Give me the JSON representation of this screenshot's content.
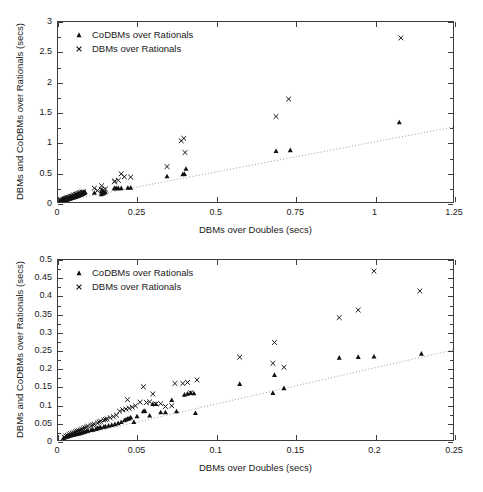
{
  "figure": {
    "panels": [
      {
        "id": "top",
        "axis": {
          "xlabel": "DBMs over Doubles (secs)",
          "ylabel": "DBMs and CoDBMs over Rationals (secs)",
          "xticks": [
            "0",
            "0.25",
            "0.5",
            "0.75",
            "1",
            "1.25"
          ],
          "yticks": [
            "0",
            "0.5",
            "1",
            "1.5",
            "2",
            "2.5",
            "3"
          ],
          "xlim": [
            0,
            1.25
          ],
          "ylim": [
            0,
            3
          ]
        },
        "legend": {
          "items": [
            {
              "label": "CoDBMs over Rationals",
              "marker": "triangle-marker"
            },
            {
              "label": "DBMs over Rationals",
              "marker": "cross-marker"
            }
          ]
        }
      },
      {
        "id": "bottom",
        "axis": {
          "xlabel": "DBMs over Doubles (secs)",
          "ylabel": "DBMs and CoDBMs over Rationals (secs)",
          "xticks": [
            "0",
            "0.05",
            "0.1",
            "0.15",
            "0.2",
            "0.25"
          ],
          "yticks": [
            "0",
            "0.05",
            "0.1",
            "0.15",
            "0.2",
            "0.25",
            "0.3",
            "0.35",
            "0.4",
            "0.45",
            "0.5"
          ],
          "xlim": [
            0,
            0.25
          ],
          "ylim": [
            0,
            0.5
          ]
        },
        "legend": {
          "items": [
            {
              "label": "CoDBMs over Rationals",
              "marker": "triangle-marker"
            },
            {
              "label": "DBMs over Rationals",
              "marker": "cross-marker"
            }
          ]
        }
      }
    ]
  },
  "colors": {
    "axis": "#3c3c3c",
    "marker": "#111111",
    "reference_line": "#9a9a9a",
    "background": "#ffffff"
  },
  "chart_data": [
    {
      "type": "scatter",
      "panel": "top",
      "title": "",
      "xlabel": "DBMs over Doubles (secs)",
      "ylabel": "DBMs and CoDBMs over Rationals (secs)",
      "xlim": [
        0,
        1.25
      ],
      "ylim": [
        0,
        3
      ],
      "grid": false,
      "legend_position": "upper-left-inside",
      "annotations": [
        {
          "kind": "reference-line",
          "label": "y = x (identity, dotted)",
          "from": [
            0,
            0
          ],
          "to": [
            1.25,
            1.25
          ],
          "style": "dotted",
          "note": "dotted guide line spanning plot"
        }
      ],
      "series": [
        {
          "name": "CoDBMs over Rationals",
          "marker": "triangle",
          "points": [
            [
              0.004,
              0.006
            ],
            [
              0.006,
              0.009
            ],
            [
              0.008,
              0.012
            ],
            [
              0.01,
              0.015
            ],
            [
              0.012,
              0.018
            ],
            [
              0.014,
              0.021
            ],
            [
              0.015,
              0.024
            ],
            [
              0.017,
              0.026
            ],
            [
              0.019,
              0.029
            ],
            [
              0.021,
              0.032
            ],
            [
              0.023,
              0.034
            ],
            [
              0.025,
              0.037
            ],
            [
              0.027,
              0.04
            ],
            [
              0.029,
              0.043
            ],
            [
              0.031,
              0.046
            ],
            [
              0.033,
              0.05
            ],
            [
              0.036,
              0.054
            ],
            [
              0.038,
              0.058
            ],
            [
              0.04,
              0.062
            ],
            [
              0.043,
              0.066
            ],
            [
              0.045,
              0.07
            ],
            [
              0.048,
              0.075
            ],
            [
              0.051,
              0.08
            ],
            [
              0.054,
              0.085
            ],
            [
              0.057,
              0.091
            ],
            [
              0.06,
              0.097
            ],
            [
              0.063,
              0.103
            ],
            [
              0.066,
              0.11
            ],
            [
              0.069,
              0.116
            ],
            [
              0.072,
              0.123
            ],
            [
              0.075,
              0.13
            ],
            [
              0.078,
              0.137
            ],
            [
              0.08,
              0.143
            ],
            [
              0.082,
              0.15
            ],
            [
              0.084,
              0.156
            ],
            [
              0.086,
              0.162
            ],
            [
              0.115,
              0.155
            ],
            [
              0.137,
              0.131
            ],
            [
              0.138,
              0.181
            ],
            [
              0.143,
              0.144
            ],
            [
              0.145,
              0.158
            ],
            [
              0.15,
              0.165
            ],
            [
              0.178,
              0.229
            ],
            [
              0.18,
              0.232
            ],
            [
              0.186,
              0.232
            ],
            [
              0.191,
              0.231
            ],
            [
              0.2,
              0.232
            ],
            [
              0.221,
              0.238
            ],
            [
              0.23,
              0.24
            ],
            [
              0.345,
              0.43
            ],
            [
              0.395,
              0.465
            ],
            [
              0.4,
              0.47
            ],
            [
              0.405,
              0.555
            ],
            [
              0.69,
              0.85
            ],
            [
              0.735,
              0.865
            ],
            [
              1.08,
              1.33
            ]
          ]
        },
        {
          "name": "DBMs over Rationals",
          "marker": "cross",
          "points": [
            [
              0.004,
              0.008
            ],
            [
              0.006,
              0.013
            ],
            [
              0.008,
              0.018
            ],
            [
              0.01,
              0.022
            ],
            [
              0.012,
              0.027
            ],
            [
              0.014,
              0.031
            ],
            [
              0.016,
              0.036
            ],
            [
              0.018,
              0.041
            ],
            [
              0.02,
              0.046
            ],
            [
              0.022,
              0.051
            ],
            [
              0.024,
              0.056
            ],
            [
              0.026,
              0.061
            ],
            [
              0.028,
              0.066
            ],
            [
              0.03,
              0.071
            ],
            [
              0.033,
              0.077
            ],
            [
              0.036,
              0.082
            ],
            [
              0.039,
              0.088
            ],
            [
              0.042,
              0.094
            ],
            [
              0.045,
              0.1
            ],
            [
              0.048,
              0.108
            ],
            [
              0.051,
              0.115
            ],
            [
              0.055,
              0.124
            ],
            [
              0.058,
              0.13
            ],
            [
              0.061,
              0.137
            ],
            [
              0.065,
              0.144
            ],
            [
              0.068,
              0.152
            ],
            [
              0.072,
              0.158
            ],
            [
              0.076,
              0.165
            ],
            [
              0.08,
              0.172
            ],
            [
              0.115,
              0.23
            ],
            [
              0.125,
              0.19
            ],
            [
              0.137,
              0.213
            ],
            [
              0.138,
              0.271
            ],
            [
              0.143,
              0.202
            ],
            [
              0.15,
              0.215
            ],
            [
              0.178,
              0.34
            ],
            [
              0.18,
              0.345
            ],
            [
              0.191,
              0.362
            ],
            [
              0.2,
              0.469
            ],
            [
              0.21,
              0.42
            ],
            [
              0.23,
              0.415
            ],
            [
              0.345,
              0.59
            ],
            [
              0.39,
              1.02
            ],
            [
              0.398,
              1.06
            ],
            [
              0.402,
              0.825
            ],
            [
              0.69,
              1.425
            ],
            [
              0.73,
              1.715
            ],
            [
              1.085,
              2.735
            ]
          ]
        }
      ]
    },
    {
      "type": "scatter",
      "panel": "bottom",
      "title": "",
      "xlabel": "DBMs over Doubles (secs)",
      "ylabel": "DBMs and CoDBMs over Rationals (secs)",
      "xlim": [
        0,
        0.25
      ],
      "ylim": [
        0,
        0.5
      ],
      "grid": false,
      "legend_position": "upper-left-inside",
      "annotations": [
        {
          "kind": "reference-line",
          "label": "y = x (identity, dotted)",
          "from": [
            0,
            0
          ],
          "to": [
            0.25,
            0.25
          ],
          "style": "dotted",
          "note": "dotted guide line spanning plot"
        }
      ],
      "series": [
        {
          "name": "CoDBMs over Rationals",
          "marker": "triangle",
          "points": [
            [
              0.0035,
              0.006
            ],
            [
              0.005,
              0.009
            ],
            [
              0.006,
              0.01
            ],
            [
              0.007,
              0.012
            ],
            [
              0.008,
              0.013
            ],
            [
              0.009,
              0.014
            ],
            [
              0.01,
              0.015
            ],
            [
              0.011,
              0.016
            ],
            [
              0.012,
              0.017
            ],
            [
              0.013,
              0.018
            ],
            [
              0.014,
              0.019
            ],
            [
              0.015,
              0.021
            ],
            [
              0.016,
              0.022
            ],
            [
              0.017,
              0.023
            ],
            [
              0.018,
              0.025
            ],
            [
              0.019,
              0.026
            ],
            [
              0.021,
              0.028
            ],
            [
              0.022,
              0.029
            ],
            [
              0.024,
              0.031
            ],
            [
              0.025,
              0.033
            ],
            [
              0.026,
              0.034
            ],
            [
              0.027,
              0.035
            ],
            [
              0.029,
              0.037
            ],
            [
              0.03,
              0.038
            ],
            [
              0.032,
              0.04
            ],
            [
              0.034,
              0.042
            ],
            [
              0.036,
              0.044
            ],
            [
              0.038,
              0.047
            ],
            [
              0.04,
              0.05
            ],
            [
              0.042,
              0.055
            ],
            [
              0.043,
              0.057
            ],
            [
              0.044,
              0.059
            ],
            [
              0.045,
              0.06
            ],
            [
              0.046,
              0.063
            ],
            [
              0.048,
              0.05
            ],
            [
              0.05,
              0.066
            ],
            [
              0.054,
              0.08
            ],
            [
              0.055,
              0.081
            ],
            [
              0.058,
              0.068
            ],
            [
              0.06,
              0.1
            ],
            [
              0.062,
              0.1
            ],
            [
              0.065,
              0.077
            ],
            [
              0.068,
              0.077
            ],
            [
              0.072,
              0.111
            ],
            [
              0.075,
              0.08
            ],
            [
              0.08,
              0.126
            ],
            [
              0.082,
              0.129
            ],
            [
              0.084,
              0.131
            ],
            [
              0.086,
              0.13
            ],
            [
              0.087,
              0.075
            ],
            [
              0.115,
              0.156
            ],
            [
              0.136,
              0.131
            ],
            [
              0.137,
              0.181
            ],
            [
              0.143,
              0.144
            ],
            [
              0.178,
              0.229
            ],
            [
              0.19,
              0.231
            ],
            [
              0.2,
              0.232
            ],
            [
              0.23,
              0.24
            ]
          ]
        },
        {
          "name": "DBMs over Rationals",
          "marker": "cross",
          "points": [
            [
              0.004,
              0.008
            ],
            [
              0.005,
              0.011
            ],
            [
              0.006,
              0.013
            ],
            [
              0.007,
              0.015
            ],
            [
              0.008,
              0.017
            ],
            [
              0.009,
              0.019
            ],
            [
              0.01,
              0.021
            ],
            [
              0.011,
              0.023
            ],
            [
              0.012,
              0.025
            ],
            [
              0.013,
              0.026
            ],
            [
              0.014,
              0.028
            ],
            [
              0.015,
              0.03
            ],
            [
              0.016,
              0.032
            ],
            [
              0.017,
              0.034
            ],
            [
              0.018,
              0.036
            ],
            [
              0.019,
              0.038
            ],
            [
              0.021,
              0.04
            ],
            [
              0.022,
              0.042
            ],
            [
              0.023,
              0.044
            ],
            [
              0.025,
              0.047
            ],
            [
              0.026,
              0.05
            ],
            [
              0.027,
              0.052
            ],
            [
              0.029,
              0.055
            ],
            [
              0.03,
              0.057
            ],
            [
              0.031,
              0.059
            ],
            [
              0.033,
              0.062
            ],
            [
              0.035,
              0.065
            ],
            [
              0.037,
              0.069
            ],
            [
              0.039,
              0.08
            ],
            [
              0.041,
              0.084
            ],
            [
              0.043,
              0.086
            ],
            [
              0.044,
              0.112
            ],
            [
              0.045,
              0.088
            ],
            [
              0.047,
              0.091
            ],
            [
              0.049,
              0.095
            ],
            [
              0.052,
              0.105
            ],
            [
              0.054,
              0.148
            ],
            [
              0.056,
              0.104
            ],
            [
              0.058,
              0.106
            ],
            [
              0.06,
              0.128
            ],
            [
              0.062,
              0.1
            ],
            [
              0.065,
              0.101
            ],
            [
              0.068,
              0.093
            ],
            [
              0.072,
              0.095
            ],
            [
              0.074,
              0.157
            ],
            [
              0.079,
              0.157
            ],
            [
              0.082,
              0.16
            ],
            [
              0.084,
              0.131
            ],
            [
              0.088,
              0.167
            ],
            [
              0.115,
              0.23
            ],
            [
              0.136,
              0.213
            ],
            [
              0.137,
              0.271
            ],
            [
              0.143,
              0.202
            ],
            [
              0.178,
              0.34
            ],
            [
              0.19,
              0.361
            ],
            [
              0.2,
              0.469
            ],
            [
              0.229,
              0.414
            ]
          ]
        }
      ]
    }
  ]
}
